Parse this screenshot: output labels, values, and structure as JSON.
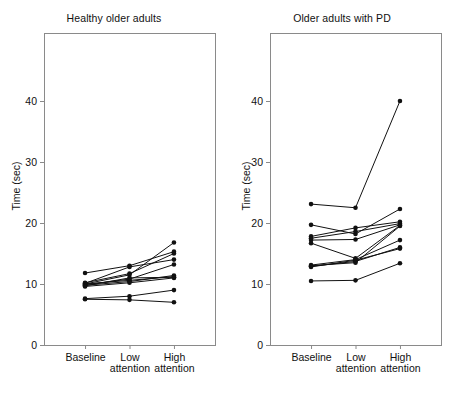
{
  "figure": {
    "width": 456,
    "height": 417,
    "background": "#ffffff",
    "ink_color": "#111111",
    "frame_color": "#8a8a8a"
  },
  "chart_data": [
    {
      "type": "line",
      "panel_index": 0,
      "title": "Healthy older adults",
      "xlabel": "",
      "ylabel": "Time (sec)",
      "categories": [
        "Baseline",
        "Low attention",
        "High attention"
      ],
      "category_lines": [
        [
          "Baseline"
        ],
        [
          "Low",
          "attention"
        ],
        [
          "High",
          "attention"
        ]
      ],
      "ylim": [
        0,
        48
      ],
      "yticks": [
        0,
        10,
        20,
        30,
        40
      ],
      "ytick_labels": [
        "0",
        "10",
        "20",
        "30",
        "40"
      ],
      "grid": false,
      "legend": "none",
      "marker": "filled-circle",
      "series": [
        {
          "name": "H1",
          "values": [
            10.0,
            11.5,
            16.8
          ]
        },
        {
          "name": "H2",
          "values": [
            11.8,
            13.0,
            15.3
          ]
        },
        {
          "name": "H3",
          "values": [
            10.2,
            11.7,
            15.0
          ]
        },
        {
          "name": "H4",
          "values": [
            10.1,
            12.8,
            14.0
          ]
        },
        {
          "name": "H5",
          "values": [
            9.9,
            10.8,
            13.2
          ]
        },
        {
          "name": "H6",
          "values": [
            9.8,
            10.4,
            11.4
          ]
        },
        {
          "name": "H7",
          "values": [
            10.0,
            10.6,
            11.2
          ]
        },
        {
          "name": "H8",
          "values": [
            9.7,
            11.0,
            11.1
          ]
        },
        {
          "name": "H9",
          "values": [
            9.6,
            10.2,
            11.0
          ]
        },
        {
          "name": "H10",
          "values": [
            7.6,
            8.0,
            9.0
          ]
        },
        {
          "name": "H11",
          "values": [
            7.5,
            7.4,
            7.0
          ]
        }
      ]
    },
    {
      "type": "line",
      "panel_index": 1,
      "title": "Older adults with PD",
      "xlabel": "",
      "ylabel": "Time (sec)",
      "categories": [
        "Baseline",
        "Low attention",
        "High attention"
      ],
      "category_lines": [
        [
          "Baseline"
        ],
        [
          "Low",
          "attention"
        ],
        [
          "High",
          "attention"
        ]
      ],
      "ylim": [
        0,
        48
      ],
      "yticks": [
        0,
        10,
        20,
        30,
        40
      ],
      "ytick_labels": [
        "0",
        "10",
        "20",
        "30",
        "40"
      ],
      "grid": false,
      "legend": "none",
      "marker": "filled-circle",
      "series": [
        {
          "name": "P1",
          "values": [
            23.1,
            22.5,
            40.0
          ]
        },
        {
          "name": "P2",
          "values": [
            19.7,
            18.2,
            22.3
          ]
        },
        {
          "name": "P3",
          "values": [
            17.8,
            19.2,
            20.2
          ]
        },
        {
          "name": "P4",
          "values": [
            17.5,
            18.6,
            19.9
          ]
        },
        {
          "name": "P5",
          "values": [
            17.2,
            17.3,
            19.7
          ]
        },
        {
          "name": "P6",
          "values": [
            16.7,
            14.2,
            19.6
          ]
        },
        {
          "name": "P7",
          "values": [
            13.1,
            14.0,
            17.2
          ]
        },
        {
          "name": "P8",
          "values": [
            12.9,
            13.7,
            16.0
          ]
        },
        {
          "name": "P9",
          "values": [
            12.8,
            13.9,
            15.8
          ]
        },
        {
          "name": "P10",
          "values": [
            13.0,
            13.5,
            19.5
          ]
        },
        {
          "name": "P11",
          "values": [
            10.5,
            10.6,
            13.4
          ]
        }
      ]
    }
  ]
}
